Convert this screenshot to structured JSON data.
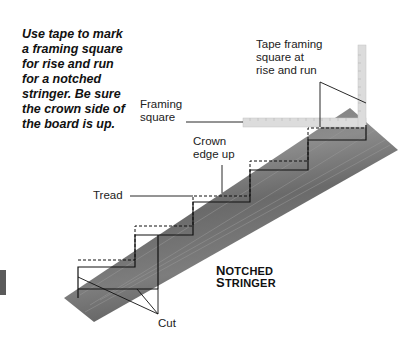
{
  "instructions": "Use tape to mark a framing square for rise and run for a notched stringer. Be sure the crown side of the board is up.",
  "labels": {
    "tape_square": [
      "Tape framing",
      "square at",
      "rise and run"
    ],
    "framing_square": [
      "Framing",
      "square"
    ],
    "crown_edge": [
      "Crown",
      "edge up"
    ],
    "tread": "Tread",
    "cut": "Cut"
  },
  "title": {
    "line1_cap": "N",
    "line1_rest": "OTCHED",
    "line2_cap": "S",
    "line2_rest": "TRINGER"
  },
  "colors": {
    "board": "#6e6e6e",
    "board_light": "#8a8a8a",
    "square": "#d9d9d9",
    "line": "#111111"
  }
}
